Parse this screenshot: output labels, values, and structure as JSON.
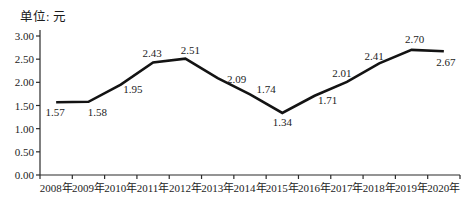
{
  "chart": {
    "unit_label": "单位: 元"
  },
  "chart_data": {
    "type": "line",
    "title": "",
    "unit": "单位: 元",
    "categories": [
      "2008年",
      "2009年",
      "2010年",
      "2011年",
      "2012年",
      "2013年",
      "2014年",
      "2015年",
      "2016年",
      "2017年",
      "2018年",
      "2019年",
      "2020年"
    ],
    "values": [
      1.57,
      1.58,
      1.95,
      2.43,
      2.51,
      2.09,
      1.74,
      1.34,
      1.71,
      2.01,
      2.41,
      2.7,
      2.67
    ],
    "point_labels": [
      "1.57",
      "1.58",
      "1.95",
      "2.43",
      "2.51",
      "2.09",
      "1.74",
      "1.34",
      "1.71",
      "2.01",
      "2.41",
      "2.70",
      "2.67"
    ],
    "xlabel": "",
    "ylabel": "",
    "ylim": [
      0,
      3
    ],
    "ytick_step": 0.5,
    "ytick_labels": [
      "0.00",
      "0.50",
      "1.00",
      "1.50",
      "2.00",
      "2.50",
      "3.00"
    ],
    "grid": false,
    "legend": false,
    "line_color": "#131313",
    "axis_color": "#2b2b2b",
    "label_offsets": [
      [
        -1,
        14
      ],
      [
        9,
        14
      ],
      [
        12,
        8
      ],
      [
        -1,
        -5
      ],
      [
        5,
        -5
      ],
      [
        19,
        5
      ],
      [
        16,
        -1
      ],
      [
        0,
        13
      ],
      [
        13,
        8
      ],
      [
        -5,
        -5
      ],
      [
        -5,
        -3
      ],
      [
        3,
        -7
      ],
      [
        2,
        15
      ]
    ]
  }
}
